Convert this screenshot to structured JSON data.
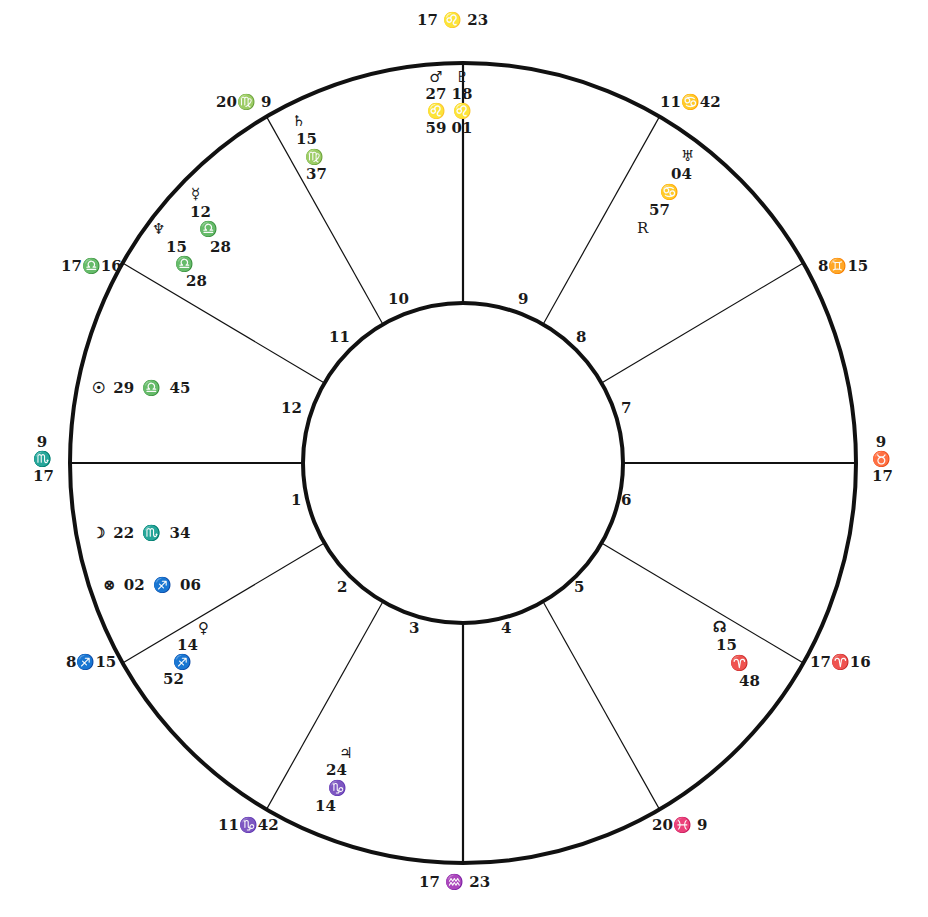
{
  "chart": {
    "center": [
      463,
      463
    ],
    "outer_rx": 393,
    "outer_ry": 400,
    "inner_r": 160,
    "line_color": "#111111",
    "cusp_angles_deg": [
      0,
      30,
      60,
      90,
      120,
      150,
      180,
      210,
      240,
      270,
      300,
      330
    ]
  },
  "cusp_labels": {
    "mc": "17 ♌ 23",
    "c11": "20♍ 9",
    "c12": "17♎16",
    "asc": [
      "9",
      "♏",
      "17"
    ],
    "c2": "8♐15",
    "c3": "11♑42",
    "ic": "17 ♒ 23",
    "c5": "20♓ 9",
    "c6": "17♈16",
    "dsc": [
      "9",
      "♉",
      "17"
    ],
    "c8": "8♊15",
    "c9": "11♋42"
  },
  "house_numbers": [
    "1",
    "2",
    "3",
    "4",
    "5",
    "6",
    "7",
    "8",
    "9",
    "10",
    "11",
    "12"
  ],
  "planets": {
    "mars": [
      "♂",
      "27",
      "♌",
      "59"
    ],
    "pluto": [
      "♇",
      "18",
      "♌",
      "01"
    ],
    "saturn": [
      "♄",
      "15",
      "♍",
      "37"
    ],
    "mercury": [
      "☿",
      "12",
      "♎",
      "28"
    ],
    "neptune": [
      "♆",
      "15",
      "♎",
      "28"
    ],
    "uranus": [
      "♅",
      "04",
      "♋",
      "57",
      "R"
    ],
    "sun": "☉ 29 ♎ 45",
    "moon": "☽ 22 ♏ 34",
    "part_of_fortune": "⊗ 02 ♐ 06",
    "venus": [
      "♀",
      "14",
      "♐",
      "52"
    ],
    "jupiter": [
      "♃",
      "24",
      "♑",
      "14"
    ],
    "north_node": [
      "☊",
      "15",
      "♈",
      "48"
    ]
  }
}
